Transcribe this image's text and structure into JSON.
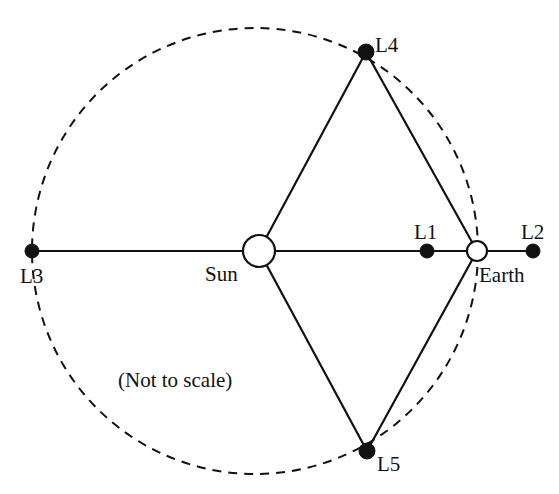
{
  "diagram": {
    "note": "(Not to scale)",
    "colors": {
      "stroke": "#111111",
      "fill_dot": "#111111",
      "fill_body": "#ffffff",
      "background": "#ffffff"
    },
    "orbit": {
      "name": "earth-orbit-dashed-circle",
      "cx": 255,
      "cy": 251,
      "r": 223,
      "dash": "9 7",
      "stroke_width": 2
    },
    "bodies": [
      {
        "id": "sun",
        "label": "Sun",
        "kind": "open-circle",
        "x": 259,
        "y": 251,
        "r": 16,
        "label_x": 205,
        "label_y": 281
      },
      {
        "id": "earth",
        "label": "Earth",
        "kind": "open-circle",
        "x": 477,
        "y": 251,
        "r": 10,
        "label_x": 479,
        "label_y": 282
      }
    ],
    "points": [
      {
        "id": "L1",
        "label": "L1",
        "kind": "filled-dot",
        "x": 427,
        "y": 251,
        "r": 7,
        "label_x": 414,
        "label_y": 239
      },
      {
        "id": "L2",
        "label": "L2",
        "kind": "filled-dot",
        "x": 533,
        "y": 251,
        "r": 7,
        "label_x": 521,
        "label_y": 239
      },
      {
        "id": "L3",
        "label": "L3",
        "kind": "filled-dot",
        "x": 32,
        "y": 251,
        "r": 7,
        "label_x": 20,
        "label_y": 283
      },
      {
        "id": "L4",
        "label": "L4",
        "kind": "filled-dot",
        "x": 366,
        "y": 52,
        "r": 8,
        "label_x": 375,
        "label_y": 52
      },
      {
        "id": "L5",
        "label": "L5",
        "kind": "filled-dot",
        "x": 367,
        "y": 451,
        "r": 8,
        "label_x": 377,
        "label_y": 471
      }
    ],
    "lines": [
      {
        "id": "axis-l3-to-l2",
        "x1": 32,
        "y1": 251,
        "x2": 533,
        "y2": 251
      },
      {
        "id": "sun-to-l4",
        "x1": 259,
        "y1": 251,
        "x2": 366,
        "y2": 52
      },
      {
        "id": "l4-to-earth",
        "x1": 366,
        "y1": 52,
        "x2": 477,
        "y2": 251
      },
      {
        "id": "sun-to-l5",
        "x1": 259,
        "y1": 251,
        "x2": 367,
        "y2": 451
      },
      {
        "id": "l5-to-earth",
        "x1": 367,
        "y1": 451,
        "x2": 477,
        "y2": 251
      }
    ],
    "note_position": {
      "x": 118,
      "y": 387
    }
  }
}
